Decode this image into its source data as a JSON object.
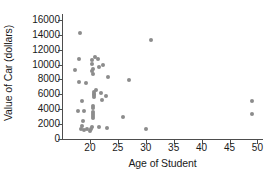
{
  "chart_data": {
    "type": "scatter",
    "title": "",
    "xlabel": "Age of Student",
    "ylabel": "Value of Car (dollars)",
    "xlim": [
      15,
      51
    ],
    "ylim": [
      0,
      16800
    ],
    "grid": false,
    "legend": null,
    "xticks": [
      20,
      25,
      30,
      35,
      40,
      45,
      50
    ],
    "xtick_labels": [
      "20",
      "25",
      "30",
      "35",
      "40",
      "45",
      "50"
    ],
    "yticks": [
      0,
      2000,
      4000,
      6000,
      8000,
      10000,
      12000,
      14000,
      16000
    ],
    "ytick_labels": [
      "0",
      "2000",
      "4000",
      "6000",
      "8000",
      "10000",
      "12000",
      "14000",
      "16000"
    ],
    "marker_color": "#8c8c8c",
    "axis_color": "#4d4d4d",
    "points": [
      {
        "x": 18.2,
        "y": 14300
      },
      {
        "x": 31.0,
        "y": 13300
      },
      {
        "x": 20.9,
        "y": 11000
      },
      {
        "x": 21.4,
        "y": 10800
      },
      {
        "x": 18.0,
        "y": 10700
      },
      {
        "x": 20.4,
        "y": 10600
      },
      {
        "x": 20.3,
        "y": 10100
      },
      {
        "x": 22.3,
        "y": 9900
      },
      {
        "x": 21.7,
        "y": 9700
      },
      {
        "x": 20.6,
        "y": 9400
      },
      {
        "x": 17.3,
        "y": 9300
      },
      {
        "x": 20.4,
        "y": 9100
      },
      {
        "x": 20.5,
        "y": 8800
      },
      {
        "x": 23.2,
        "y": 8300
      },
      {
        "x": 27.0,
        "y": 7900
      },
      {
        "x": 18.1,
        "y": 7600
      },
      {
        "x": 19.3,
        "y": 7500
      },
      {
        "x": 21.0,
        "y": 6600
      },
      {
        "x": 20.8,
        "y": 6300
      },
      {
        "x": 22.0,
        "y": 6200
      },
      {
        "x": 20.7,
        "y": 6000
      },
      {
        "x": 20.8,
        "y": 5900
      },
      {
        "x": 22.9,
        "y": 5800
      },
      {
        "x": 20.7,
        "y": 5600
      },
      {
        "x": 22.1,
        "y": 5300
      },
      {
        "x": 18.6,
        "y": 5100
      },
      {
        "x": 49.0,
        "y": 5100
      },
      {
        "x": 20.6,
        "y": 4500
      },
      {
        "x": 20.6,
        "y": 4200
      },
      {
        "x": 17.9,
        "y": 3800
      },
      {
        "x": 18.9,
        "y": 3700
      },
      {
        "x": 20.6,
        "y": 3600
      },
      {
        "x": 49.0,
        "y": 3350
      },
      {
        "x": 20.6,
        "y": 3300
      },
      {
        "x": 20.6,
        "y": 3050
      },
      {
        "x": 26.0,
        "y": 3000
      },
      {
        "x": 20.6,
        "y": 2800
      },
      {
        "x": 18.7,
        "y": 2400
      },
      {
        "x": 18.5,
        "y": 1700
      },
      {
        "x": 20.3,
        "y": 1600
      },
      {
        "x": 21.7,
        "y": 1550
      },
      {
        "x": 23.1,
        "y": 1500
      },
      {
        "x": 18.4,
        "y": 1400
      },
      {
        "x": 19.4,
        "y": 1350
      },
      {
        "x": 20.2,
        "y": 1300
      },
      {
        "x": 30.0,
        "y": 1300
      },
      {
        "x": 19.0,
        "y": 1150
      },
      {
        "x": 20.0,
        "y": 1100
      }
    ]
  }
}
